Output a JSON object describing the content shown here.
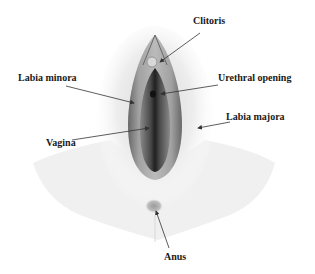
{
  "diagram": {
    "labels": {
      "clitoris": "Clitoris",
      "labia_minora": "Labia minora",
      "urethral_opening": "Urethral opening",
      "labia_majora": "Labia majora",
      "vagina": "Vagina",
      "anus": "Anus"
    },
    "colors": {
      "background": "#ffffff",
      "text": "#1a1a1a",
      "arrow": "#333333",
      "tissue_dark": "#2a2a2a",
      "tissue_mid": "#8a8a8a",
      "tissue_light": "#e6e6e6"
    }
  }
}
